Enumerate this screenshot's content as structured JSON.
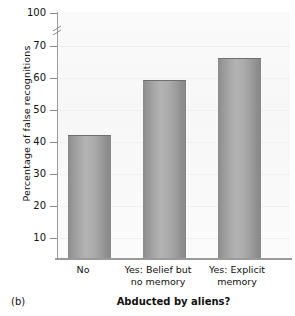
{
  "figure": {
    "panel_label": "(b)"
  },
  "chart_data": {
    "type": "bar",
    "title": "",
    "xlabel": "Abducted by aliens?",
    "ylabel": "Percentage of false recognitions",
    "categories": [
      "No",
      "Yes: Belief but no memory",
      "Yes: Explicit memory"
    ],
    "category_lines": [
      [
        "No"
      ],
      [
        "Yes: Belief but",
        "no memory"
      ],
      [
        "Yes: Explicit",
        "memory"
      ]
    ],
    "values": [
      42,
      59,
      66
    ],
    "ylim": [
      0,
      100
    ],
    "yticks": [
      10,
      20,
      30,
      40,
      50,
      60,
      70,
      100
    ],
    "ytick_labels": [
      "10",
      "20",
      "30",
      "40",
      "50",
      "60",
      "70",
      "100"
    ],
    "axis_break": {
      "between": [
        70,
        100
      ],
      "present": true
    },
    "grid": true,
    "legend": null,
    "bar_color": "#a5a5a5",
    "bar_edge_color": "#6f6f6f"
  }
}
